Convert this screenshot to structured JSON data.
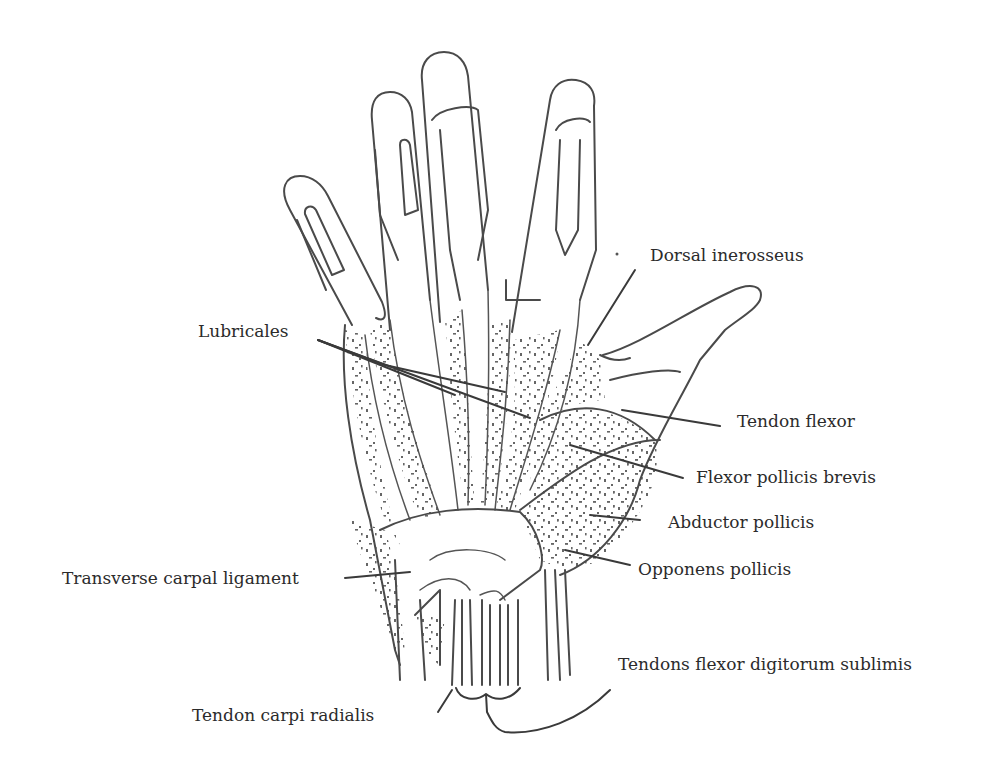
{
  "figure": {
    "stroke_color": "#4a4a4a",
    "background": "#ffffff"
  },
  "labels": {
    "dorsal_interosseus": "Dorsal inerosseus",
    "lubricales": "Lubricales",
    "tendon_flexor": "Tendon flexor",
    "flexor_pollicis_brevis": "Flexor pollicis brevis",
    "abductor_pollicis": "Abductor pollicis",
    "opponens_pollicis": "Opponens pollicis",
    "transverse_carpal_ligament": "Transverse carpal ligament",
    "tendons_flexor_digitorum_sublimis": "Tendons flexor digitorum sublimis",
    "tendon_carpi_radialis": "Tendon carpi radialis"
  }
}
